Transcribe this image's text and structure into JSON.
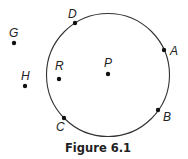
{
  "figure": {
    "caption": "Figure 6.1",
    "circle": {
      "center_label": "P"
    },
    "points_on_circle": [
      {
        "label": "D"
      },
      {
        "label": "A"
      },
      {
        "label": "B"
      },
      {
        "label": "C"
      }
    ],
    "points_inside": [
      {
        "label": "P"
      },
      {
        "label": "R"
      }
    ],
    "points_outside": [
      {
        "label": "G"
      },
      {
        "label": "H"
      }
    ]
  }
}
